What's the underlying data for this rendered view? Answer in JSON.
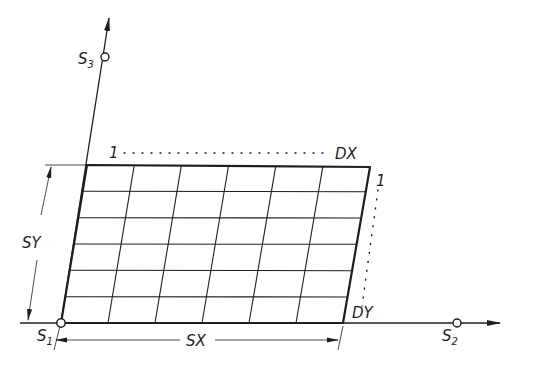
{
  "diagram": {
    "type": "skewed-grid-mapping",
    "colors": {
      "ink": "#1e1e1e",
      "background": "#ffffff"
    },
    "grid": {
      "columns": 6,
      "rows": 6
    },
    "points": {
      "s1": {
        "label": "S",
        "sub": "1"
      },
      "s2": {
        "label": "S",
        "sub": "2"
      },
      "s3": {
        "label": "S",
        "sub": "3"
      }
    },
    "labels": {
      "top_left_one": "1",
      "dx": "DX",
      "right_one": "1",
      "dy": "DY",
      "sx": "SX",
      "sy": "SY"
    }
  }
}
